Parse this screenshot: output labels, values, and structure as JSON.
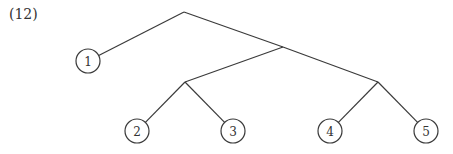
{
  "example_label": "(12)",
  "tree": {
    "internal_nodes": [
      {
        "id": "root",
        "x": 184,
        "y": 12
      },
      {
        "id": "n1",
        "x": 283,
        "y": 47
      },
      {
        "id": "n2",
        "x": 185,
        "y": 82
      },
      {
        "id": "n3",
        "x": 378,
        "y": 82
      }
    ],
    "leaves": [
      {
        "id": "leaf1",
        "label": "1",
        "x": 88,
        "y": 61
      },
      {
        "id": "leaf2",
        "label": "2",
        "x": 137,
        "y": 131
      },
      {
        "id": "leaf3",
        "label": "3",
        "x": 233,
        "y": 131
      },
      {
        "id": "leaf4",
        "label": "4",
        "x": 330,
        "y": 131
      },
      {
        "id": "leaf5",
        "label": "5",
        "x": 426,
        "y": 131
      }
    ],
    "edges": [
      [
        "root",
        "leaf1"
      ],
      [
        "root",
        "n1"
      ],
      [
        "n1",
        "n2"
      ],
      [
        "n1",
        "n3"
      ],
      [
        "n2",
        "leaf2"
      ],
      [
        "n2",
        "leaf3"
      ],
      [
        "n3",
        "leaf4"
      ],
      [
        "n3",
        "leaf5"
      ]
    ],
    "leaf_radius": 12
  }
}
